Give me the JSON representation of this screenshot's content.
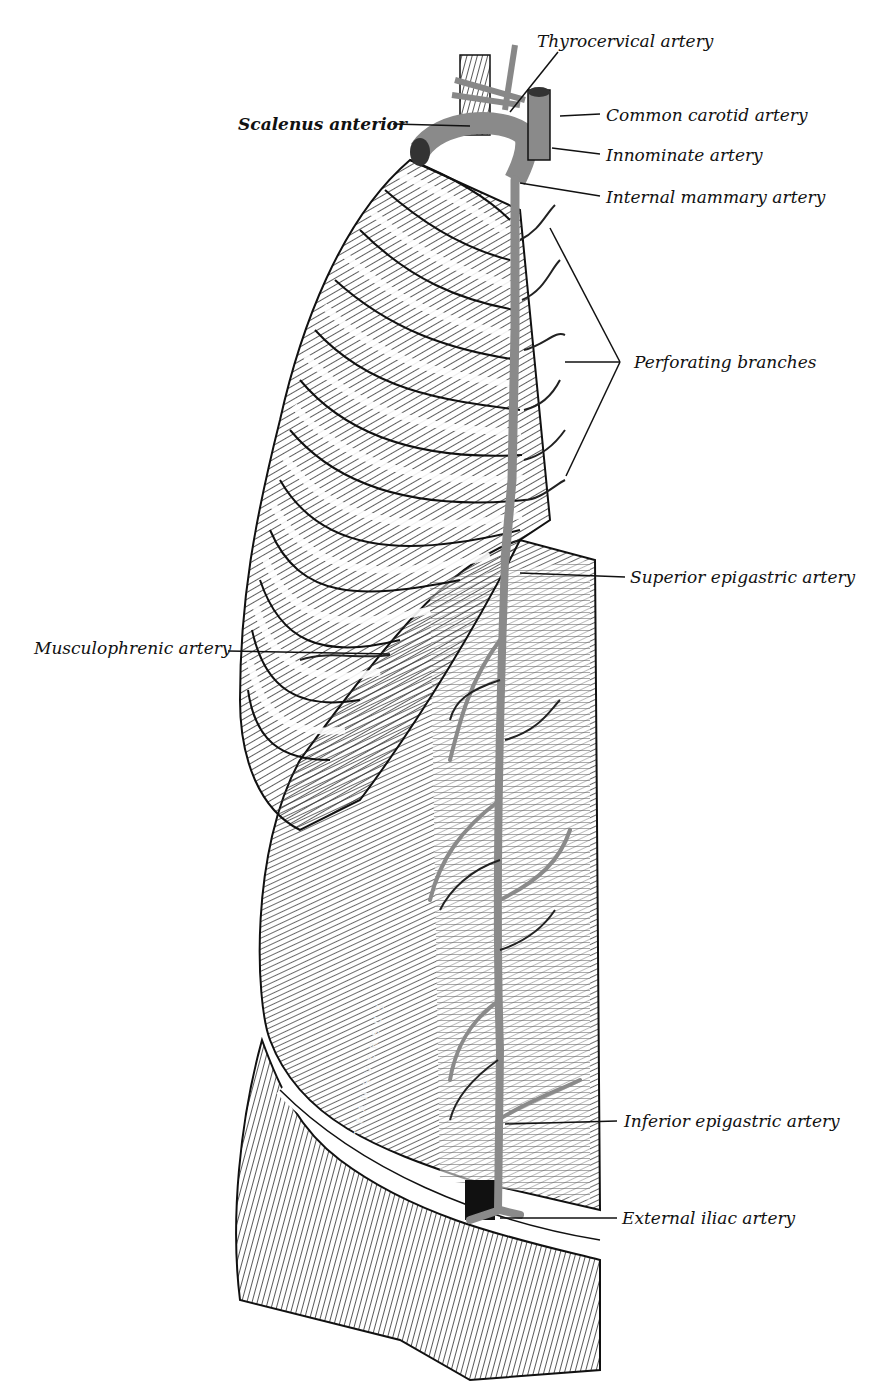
{
  "figure": {
    "colors": {
      "background": "#ffffff",
      "ink": "#111111",
      "artery": "#8a8a8a",
      "muscle_dark": "#3a3a3a"
    },
    "muscle_inscription": "TRANSVERSUS",
    "labels": [
      {
        "id": "thyrocervical",
        "text": "Thyrocervical artery",
        "x": 537,
        "y": 31,
        "bold": false
      },
      {
        "id": "scalenus",
        "text": "Scalenus anterior",
        "x": 238,
        "y": 114,
        "bold": true
      },
      {
        "id": "common_carotid",
        "text": "Common carotid artery",
        "x": 606,
        "y": 105,
        "bold": false
      },
      {
        "id": "innominate",
        "text": "Innominate artery",
        "x": 606,
        "y": 145,
        "bold": false
      },
      {
        "id": "internal_mammary",
        "text": "Internal mammary artery",
        "x": 606,
        "y": 187,
        "bold": false
      },
      {
        "id": "perforating",
        "text": "Perforating branches",
        "x": 634,
        "y": 352,
        "bold": false
      },
      {
        "id": "superior_epigastric",
        "text": "Superior epigastric artery",
        "x": 630,
        "y": 567,
        "bold": false
      },
      {
        "id": "musculophrenic",
        "text": "Musculophrenic artery",
        "x": 34,
        "y": 638,
        "bold": false
      },
      {
        "id": "inferior_epigastric",
        "text": "Inferior epigastric artery",
        "x": 624,
        "y": 1111,
        "bold": false
      },
      {
        "id": "external_iliac",
        "text": "External iliac artery",
        "x": 622,
        "y": 1208,
        "bold": false
      }
    ]
  }
}
